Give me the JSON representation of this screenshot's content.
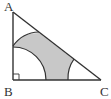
{
  "diagram": {
    "type": "right-triangle-with-arcs",
    "vertices": {
      "A": {
        "label": "A",
        "x": 13,
        "y": 12
      },
      "B": {
        "label": "B",
        "x": 13,
        "y": 80
      },
      "C": {
        "label": "C",
        "x": 101,
        "y": 80
      }
    },
    "right_angle_at": "B",
    "arc_radius": 33,
    "shaded_region": "inside triangle, outside three vertex-centered arcs",
    "colors": {
      "stroke": "#333333",
      "shade": "#c8c8c8",
      "background": "#ffffff"
    }
  }
}
